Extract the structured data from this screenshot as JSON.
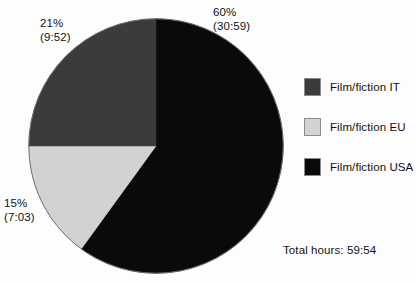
{
  "chart_data": {
    "type": "pie",
    "title": "",
    "subtitle": "",
    "xlabel": "",
    "ylabel": "",
    "grid": false,
    "legend_position": "right",
    "start_angle_deg": 0,
    "direction": "clockwise",
    "total_label": "Total hours: 59:54",
    "total_value": "59:54",
    "categories": [
      "Film/fiction USA",
      "Film/fiction EU",
      "Film/fiction IT"
    ],
    "values": [
      60,
      15,
      21
    ],
    "slices": [
      {
        "name": "Film/fiction USA",
        "percent": 60,
        "percent_label": "60%",
        "duration_label": "(30:59)",
        "duration": "30:59",
        "color": "#0a0a0a",
        "start_deg": 0,
        "end_deg": 216
      },
      {
        "name": "Film/fiction EU",
        "percent": 15,
        "percent_label": "15%",
        "duration_label": "(7:03)",
        "duration": "7:03",
        "color": "#d2d2d2",
        "start_deg": 216,
        "end_deg": 270
      },
      {
        "name": "Film/fiction IT",
        "percent": 21,
        "percent_label": "21%",
        "duration_label": "(9:52)",
        "duration": "9:52",
        "color": "#3b3b3b",
        "start_deg": 270,
        "end_deg": 360
      }
    ],
    "legend": [
      {
        "label": "Film/fiction IT",
        "color": "#3b3b3b"
      },
      {
        "label": "Film/fiction EU",
        "color": "#d2d2d2"
      },
      {
        "label": "Film/fiction USA",
        "color": "#0a0a0a"
      }
    ]
  },
  "callouts": {
    "usa": {
      "percent": "60%",
      "duration": "(30:59)"
    },
    "it": {
      "percent": "21%",
      "duration": "(9:52)"
    },
    "eu": {
      "percent": "15%",
      "duration": "(7:03)"
    }
  },
  "footer": {
    "total_hours": "Total hours: 59:54"
  }
}
